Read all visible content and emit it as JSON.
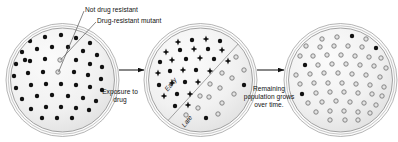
{
  "diagram": {
    "background_color": "#ffffff",
    "text_color": "#111111",
    "annotations": {
      "not_resistant": "Not drug resistant",
      "resistant_mutant": "Drug-resistant mutant",
      "exposure": "Exposure to drug",
      "remaining": "Remaining population grows over time.",
      "early": "Early",
      "late": "Late"
    },
    "dishes": [
      {
        "name": "initial-population",
        "cx": 62.5,
        "cy": 80,
        "rx": 52,
        "ry": 52,
        "fill": "#f1f1f1",
        "rim_color": "#8d8d8d",
        "colonies": [
          {
            "type": "solid",
            "x": 30,
            "y": 41
          },
          {
            "type": "solid",
            "x": 45,
            "y": 37
          },
          {
            "type": "solid",
            "x": 61,
            "y": 35
          },
          {
            "type": "solid",
            "x": 76,
            "y": 38
          },
          {
            "type": "solid",
            "x": 90,
            "y": 43
          },
          {
            "type": "solid",
            "x": 22,
            "y": 52
          },
          {
            "type": "solid",
            "x": 37,
            "y": 49
          },
          {
            "type": "solid",
            "x": 52,
            "y": 47
          },
          {
            "type": "solid",
            "x": 68,
            "y": 47
          },
          {
            "type": "solid",
            "x": 83,
            "y": 51
          },
          {
            "type": "solid",
            "x": 97,
            "y": 55
          },
          {
            "type": "solid",
            "x": 16,
            "y": 64
          },
          {
            "type": "solid",
            "x": 30,
            "y": 61
          },
          {
            "type": "solid",
            "x": 45,
            "y": 59
          },
          {
            "type": "solid",
            "x": 76,
            "y": 60
          },
          {
            "type": "solid",
            "x": 90,
            "y": 64
          },
          {
            "type": "solid",
            "x": 102,
            "y": 67
          },
          {
            "type": "open",
            "x": 60,
            "y": 60
          },
          {
            "type": "solid",
            "x": 14,
            "y": 76
          },
          {
            "type": "solid",
            "x": 28,
            "y": 73
          },
          {
            "type": "solid",
            "x": 43,
            "y": 72
          },
          {
            "type": "solid",
            "x": 74,
            "y": 72
          },
          {
            "type": "solid",
            "x": 88,
            "y": 75
          },
          {
            "type": "solid",
            "x": 101,
            "y": 79
          },
          {
            "type": "open",
            "x": 58,
            "y": 72
          },
          {
            "type": "solid",
            "x": 16,
            "y": 88
          },
          {
            "type": "solid",
            "x": 31,
            "y": 85
          },
          {
            "type": "solid",
            "x": 46,
            "y": 84
          },
          {
            "type": "solid",
            "x": 61,
            "y": 84
          },
          {
            "type": "solid",
            "x": 76,
            "y": 85
          },
          {
            "type": "solid",
            "x": 90,
            "y": 87
          },
          {
            "type": "solid",
            "x": 102,
            "y": 90
          },
          {
            "type": "solid",
            "x": 22,
            "y": 99
          },
          {
            "type": "solid",
            "x": 37,
            "y": 96
          },
          {
            "type": "solid",
            "x": 52,
            "y": 95
          },
          {
            "type": "solid",
            "x": 68,
            "y": 96
          },
          {
            "type": "solid",
            "x": 83,
            "y": 98
          },
          {
            "type": "solid",
            "x": 96,
            "y": 101
          },
          {
            "type": "solid",
            "x": 31,
            "y": 109
          },
          {
            "type": "solid",
            "x": 46,
            "y": 107
          },
          {
            "type": "solid",
            "x": 61,
            "y": 107
          },
          {
            "type": "solid",
            "x": 76,
            "y": 108
          },
          {
            "type": "solid",
            "x": 89,
            "y": 110
          },
          {
            "type": "solid",
            "x": 42,
            "y": 118
          },
          {
            "type": "solid",
            "x": 57,
            "y": 118
          },
          {
            "type": "solid",
            "x": 72,
            "y": 118
          },
          {
            "type": "solid",
            "x": 25,
            "y": 60
          },
          {
            "type": "solid",
            "x": 95,
            "y": 35
          }
        ]
      },
      {
        "name": "drug-exposed",
        "cx": 200.5,
        "cy": 80,
        "rx": 52,
        "ry": 52,
        "fill": "#f1f1f1",
        "rim_color": "#8d8d8d",
        "divider": {
          "x1": 163,
          "y1": 126,
          "x2": 240,
          "y2": 42
        },
        "colonies": [
          {
            "type": "burst",
            "x": 178,
            "y": 42
          },
          {
            "type": "solid",
            "x": 192,
            "y": 40
          },
          {
            "type": "burst",
            "x": 206,
            "y": 39
          },
          {
            "type": "solid",
            "x": 220,
            "y": 41
          },
          {
            "type": "burst",
            "x": 166,
            "y": 52
          },
          {
            "type": "solid",
            "x": 180,
            "y": 50
          },
          {
            "type": "burst",
            "x": 194,
            "y": 49
          },
          {
            "type": "solid",
            "x": 208,
            "y": 49
          },
          {
            "type": "burst",
            "x": 222,
            "y": 50
          },
          {
            "type": "solid",
            "x": 160,
            "y": 62
          },
          {
            "type": "burst",
            "x": 172,
            "y": 60
          },
          {
            "type": "solid",
            "x": 186,
            "y": 59
          },
          {
            "type": "burst",
            "x": 200,
            "y": 58
          },
          {
            "type": "solid",
            "x": 214,
            "y": 59
          },
          {
            "type": "burst",
            "x": 228,
            "y": 61
          },
          {
            "type": "burst",
            "x": 158,
            "y": 73
          },
          {
            "type": "solid",
            "x": 170,
            "y": 71
          },
          {
            "type": "burst",
            "x": 183,
            "y": 70
          },
          {
            "type": "solid",
            "x": 196,
            "y": 70
          },
          {
            "type": "burst",
            "x": 210,
            "y": 71
          },
          {
            "type": "open",
            "x": 222,
            "y": 73
          },
          {
            "type": "solid",
            "x": 159,
            "y": 85
          },
          {
            "type": "burst",
            "x": 172,
            "y": 83
          },
          {
            "type": "solid",
            "x": 185,
            "y": 82
          },
          {
            "type": "burst",
            "x": 198,
            "y": 82
          },
          {
            "type": "open",
            "x": 210,
            "y": 84
          },
          {
            "type": "burst",
            "x": 164,
            "y": 96
          },
          {
            "type": "solid",
            "x": 177,
            "y": 94
          },
          {
            "type": "burst",
            "x": 190,
            "y": 94
          },
          {
            "type": "open",
            "x": 200,
            "y": 96
          },
          {
            "type": "solid",
            "x": 175,
            "y": 106
          },
          {
            "type": "burst",
            "x": 188,
            "y": 105
          },
          {
            "type": "open",
            "x": 236,
            "y": 57
          },
          {
            "type": "open",
            "x": 244,
            "y": 70
          },
          {
            "type": "open",
            "x": 232,
            "y": 78
          },
          {
            "type": "solid",
            "x": 244,
            "y": 85
          },
          {
            "type": "open",
            "x": 220,
            "y": 88
          },
          {
            "type": "open",
            "x": 234,
            "y": 94
          },
          {
            "type": "open",
            "x": 209,
            "y": 97
          },
          {
            "type": "open",
            "x": 222,
            "y": 103
          },
          {
            "type": "open",
            "x": 198,
            "y": 108
          },
          {
            "type": "solid",
            "x": 206,
            "y": 118
          },
          {
            "type": "open",
            "x": 218,
            "y": 114
          },
          {
            "type": "open",
            "x": 186,
            "y": 115
          }
        ]
      },
      {
        "name": "resistant-population",
        "cx": 340.5,
        "cy": 80,
        "rx": 52,
        "ry": 52,
        "fill": "#f1f1f1",
        "rim_color": "#8d8d8d",
        "colonies": [
          {
            "type": "open",
            "x": 322,
            "y": 39
          },
          {
            "type": "open",
            "x": 337,
            "y": 37
          },
          {
            "type": "solid",
            "x": 352,
            "y": 36
          },
          {
            "type": "open",
            "x": 366,
            "y": 39
          },
          {
            "type": "open",
            "x": 306,
            "y": 46
          },
          {
            "type": "open",
            "x": 320,
            "y": 47
          },
          {
            "type": "open",
            "x": 334,
            "y": 46
          },
          {
            "type": "open",
            "x": 348,
            "y": 46
          },
          {
            "type": "open",
            "x": 362,
            "y": 47
          },
          {
            "type": "solid",
            "x": 376,
            "y": 48
          },
          {
            "type": "open",
            "x": 300,
            "y": 56
          },
          {
            "type": "open",
            "x": 313,
            "y": 56
          },
          {
            "type": "open",
            "x": 327,
            "y": 55
          },
          {
            "type": "open",
            "x": 341,
            "y": 55
          },
          {
            "type": "open",
            "x": 355,
            "y": 56
          },
          {
            "type": "open",
            "x": 369,
            "y": 57
          },
          {
            "type": "open",
            "x": 381,
            "y": 58
          },
          {
            "type": "solid",
            "x": 305,
            "y": 65
          },
          {
            "type": "open",
            "x": 318,
            "y": 65
          },
          {
            "type": "open",
            "x": 332,
            "y": 64
          },
          {
            "type": "open",
            "x": 346,
            "y": 64
          },
          {
            "type": "open",
            "x": 360,
            "y": 65
          },
          {
            "type": "open",
            "x": 374,
            "y": 66
          },
          {
            "type": "open",
            "x": 386,
            "y": 68
          },
          {
            "type": "open",
            "x": 296,
            "y": 75
          },
          {
            "type": "open",
            "x": 310,
            "y": 74
          },
          {
            "type": "open",
            "x": 324,
            "y": 73
          },
          {
            "type": "open",
            "x": 338,
            "y": 73
          },
          {
            "type": "open",
            "x": 352,
            "y": 74
          },
          {
            "type": "open",
            "x": 366,
            "y": 75
          },
          {
            "type": "open",
            "x": 380,
            "y": 77
          },
          {
            "type": "open",
            "x": 300,
            "y": 84
          },
          {
            "type": "open",
            "x": 314,
            "y": 83
          },
          {
            "type": "open",
            "x": 328,
            "y": 83
          },
          {
            "type": "open",
            "x": 342,
            "y": 83
          },
          {
            "type": "open",
            "x": 356,
            "y": 84
          },
          {
            "type": "open",
            "x": 370,
            "y": 85
          },
          {
            "type": "open",
            "x": 384,
            "y": 87
          },
          {
            "type": "solid",
            "x": 302,
            "y": 94
          },
          {
            "type": "open",
            "x": 316,
            "y": 93
          },
          {
            "type": "open",
            "x": 330,
            "y": 92
          },
          {
            "type": "open",
            "x": 344,
            "y": 92
          },
          {
            "type": "open",
            "x": 358,
            "y": 93
          },
          {
            "type": "open",
            "x": 372,
            "y": 94
          },
          {
            "type": "open",
            "x": 382,
            "y": 96
          },
          {
            "type": "open",
            "x": 308,
            "y": 103
          },
          {
            "type": "open",
            "x": 322,
            "y": 102
          },
          {
            "type": "open",
            "x": 336,
            "y": 101
          },
          {
            "type": "open",
            "x": 350,
            "y": 102
          },
          {
            "type": "open",
            "x": 364,
            "y": 103
          },
          {
            "type": "open",
            "x": 376,
            "y": 105
          },
          {
            "type": "open",
            "x": 316,
            "y": 112
          },
          {
            "type": "open",
            "x": 330,
            "y": 111
          },
          {
            "type": "open",
            "x": 344,
            "y": 111
          },
          {
            "type": "open",
            "x": 358,
            "y": 112
          },
          {
            "type": "open",
            "x": 370,
            "y": 113
          },
          {
            "type": "open",
            "x": 330,
            "y": 120
          },
          {
            "type": "open",
            "x": 345,
            "y": 120
          },
          {
            "type": "open",
            "x": 358,
            "y": 120
          }
        ]
      }
    ],
    "arrows": [
      {
        "name": "arrow-exposure",
        "x1": 119,
        "y1": 70,
        "x2": 144,
        "y2": 70
      },
      {
        "name": "arrow-regrowth",
        "x1": 257,
        "y1": 70,
        "x2": 284,
        "y2": 70
      }
    ],
    "leaders": [
      {
        "name": "leader-not-resistant",
        "x1": 84,
        "y1": 11,
        "x2": 58.5,
        "y2": 72
      },
      {
        "name": "leader-resistant-mutant",
        "x1": 96,
        "y1": 22,
        "x2": 60.5,
        "y2": 60
      }
    ],
    "legend_shapes": {
      "solid": "solid-black-dot",
      "open": "open-gray-circle",
      "burst": "black-burst-star"
    },
    "colors": {
      "dish_fill": "#f1f1f1",
      "dish_rim": "#8d8d8d",
      "solid_colony": "#111111",
      "open_colony_fill": "#e2e2e2",
      "open_colony_stroke": "#7a7a7a",
      "arrow": "#111111",
      "leader": "#555555"
    }
  }
}
